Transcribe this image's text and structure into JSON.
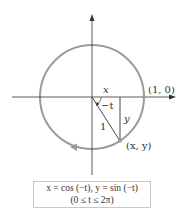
{
  "figure": {
    "labels": {
      "x_segment": "x",
      "angle": "−t",
      "y_segment": "y",
      "radius": "1",
      "start_point": "(1, 0)",
      "moving_point": "(x, y)"
    },
    "caption": {
      "line1": "x = cos (−t),  y = sin (−t)",
      "line2": "(0 ≤ t ≤ 2π)"
    },
    "colors": {
      "circle": "#9b9b9b",
      "axes": "#333333",
      "text": "#333333"
    },
    "geometry": {
      "origin": [
        92,
        97
      ],
      "radius": 52,
      "point": [
        120,
        141
      ]
    }
  }
}
